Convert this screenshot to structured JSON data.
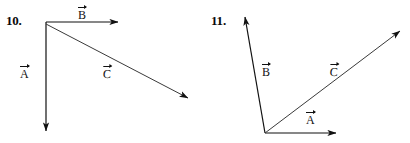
{
  "page": {
    "background_color": "#ffffff",
    "ink_color": "#111111",
    "width": 410,
    "height": 143
  },
  "figures": [
    {
      "number_label": "10.",
      "vectors": [
        {
          "name": "A",
          "label": "A",
          "notation": "overarrow",
          "start": {
            "x": 46,
            "y": 22
          },
          "end": {
            "x": 46,
            "y": 135
          },
          "direction": "down",
          "label_pos": {
            "x": 20,
            "y": 64
          }
        },
        {
          "name": "B",
          "label": "B",
          "notation": "overarrow",
          "start": {
            "x": 46,
            "y": 22
          },
          "end": {
            "x": 122,
            "y": 22
          },
          "direction": "right",
          "label_pos": {
            "x": 78,
            "y": 5
          }
        },
        {
          "name": "C",
          "label": "C",
          "notation": "overarrow",
          "start": {
            "x": 46,
            "y": 24
          },
          "end": {
            "x": 193,
            "y": 101
          },
          "direction": "down-right",
          "label_pos": {
            "x": 103,
            "y": 64
          }
        }
      ]
    },
    {
      "number_label": "11.",
      "vectors": [
        {
          "name": "B",
          "label": "B",
          "notation": "overarrow",
          "start": {
            "x": 265,
            "y": 133
          },
          "end": {
            "x": 244,
            "y": 13
          },
          "direction": "up",
          "label_pos": {
            "x": 262,
            "y": 62
          }
        },
        {
          "name": "A",
          "label": "A",
          "notation": "overarrow",
          "start": {
            "x": 265,
            "y": 133
          },
          "end": {
            "x": 340,
            "y": 133
          },
          "direction": "right",
          "label_pos": {
            "x": 306,
            "y": 110
          }
        },
        {
          "name": "C",
          "label": "C",
          "notation": "overarrow",
          "start": {
            "x": 265,
            "y": 133
          },
          "end": {
            "x": 405,
            "y": 27
          },
          "direction": "up-right",
          "label_pos": {
            "x": 330,
            "y": 62
          }
        }
      ]
    }
  ]
}
